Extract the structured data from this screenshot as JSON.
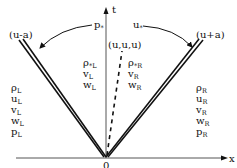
{
  "diagram": {
    "axes": {
      "x_label": "x",
      "t_label": "t",
      "origin_label": "0"
    },
    "waves": {
      "left": {
        "label": "(u-a)",
        "type": "double-line"
      },
      "contact": {
        "label": "(u,u,u)",
        "type": "dashed-line"
      },
      "right": {
        "label": "(u+a)",
        "type": "double-line"
      }
    },
    "star_labels": {
      "p_star": {
        "base": "p",
        "sub": "*"
      },
      "u_star": {
        "base": "u",
        "sub": "*"
      }
    },
    "regions": {
      "left_state": [
        {
          "base": "ρ",
          "sub": "L"
        },
        {
          "base": "u",
          "sub": "L"
        },
        {
          "base": "v",
          "sub": "L"
        },
        {
          "base": "w",
          "sub": "L"
        },
        {
          "base": "p",
          "sub": "L"
        }
      ],
      "star_left": [
        {
          "base": "ρ",
          "sub": "*L"
        },
        {
          "base": "v",
          "sub": "L"
        },
        {
          "base": "w",
          "sub": "L"
        }
      ],
      "star_right": [
        {
          "base": "ρ",
          "sub": "*R"
        },
        {
          "base": "v",
          "sub": "R"
        },
        {
          "base": "w",
          "sub": "R"
        }
      ],
      "right_state": [
        {
          "base": "ρ",
          "sub": "R"
        },
        {
          "base": "u",
          "sub": "R"
        },
        {
          "base": "v",
          "sub": "R"
        },
        {
          "base": "w",
          "sub": "R"
        },
        {
          "base": "p",
          "sub": "R"
        }
      ]
    },
    "colors": {
      "ink": "#111111",
      "axis": "#555555",
      "background": "#ffffff"
    }
  }
}
